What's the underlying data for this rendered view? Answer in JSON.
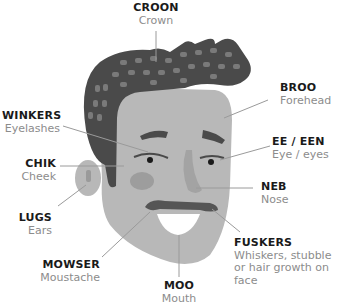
{
  "colors": {
    "hair": "#4a4a4a",
    "hair_spots": "#7a7a7a",
    "skin": "#b8b8b8",
    "cheek": "#9d9d9d",
    "moustache": "#555555",
    "mouth": "#ffffff",
    "leader_line": "#9a9a9a",
    "term": "#1a1a1a",
    "gloss": "#8c8c8c"
  },
  "labels": [
    {
      "id": "croon",
      "term": "CROON",
      "gloss": "Crown"
    },
    {
      "id": "broo",
      "term": "BROO",
      "gloss": "Forehead"
    },
    {
      "id": "winkers",
      "term": "WINKERS",
      "gloss": "Eyelashes"
    },
    {
      "id": "ee-een",
      "term": "EE / EEN",
      "gloss": "Eye / eyes"
    },
    {
      "id": "chik",
      "term": "CHIK",
      "gloss": "Cheek"
    },
    {
      "id": "neb",
      "term": "NEB",
      "gloss": "Nose"
    },
    {
      "id": "lugs",
      "term": "LUGS",
      "gloss": "Ears"
    },
    {
      "id": "fuskers",
      "term": "FUSKERS",
      "gloss": "Whiskers, stubble or hair growth on face"
    },
    {
      "id": "mowser",
      "term": "MOWSER",
      "gloss": "Moustache"
    },
    {
      "id": "moo",
      "term": "MOO",
      "gloss": "Mouth"
    }
  ]
}
